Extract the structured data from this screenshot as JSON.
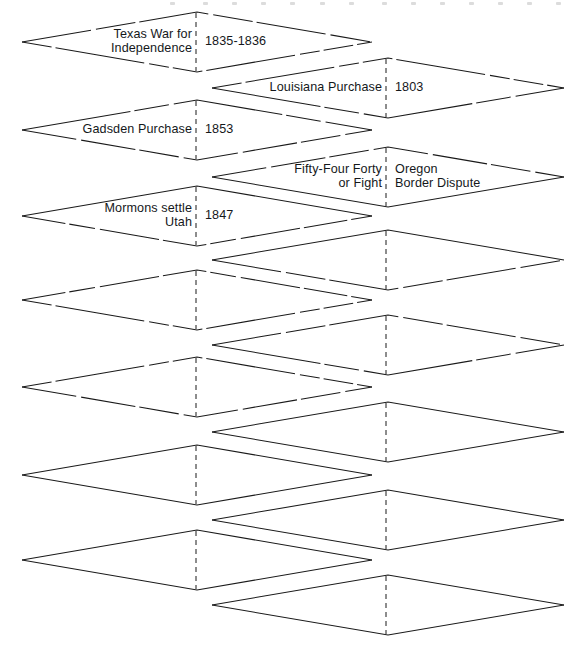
{
  "diagram": {
    "type": "overlapping-diamond-matching-chart",
    "orientation": "vertical-zigzag-staircase",
    "stroke_color": "#1a1a1a",
    "text_color": "#15181b",
    "background_color": "#ffffff",
    "divider_style": "dashed-vertical-center-line",
    "columns": {
      "left": {
        "x_left": 22,
        "x_right": 372,
        "center_x": 196
      },
      "right": {
        "x_left": 212,
        "x_right": 564,
        "center_x": 386
      }
    },
    "row_spacing_px": 43,
    "total_shapes": 14,
    "filled_shapes": 5,
    "empty_shapes": 9,
    "shapes": [
      {
        "index": 1,
        "column": "left",
        "center_y": 42,
        "left_label": "Texas War for\nIndependence",
        "right_label": "1835-1836",
        "filled": true
      },
      {
        "index": 2,
        "column": "right",
        "center_y": 88,
        "left_label": "Louisiana Purchase",
        "right_label": "1803",
        "filled": true
      },
      {
        "index": 3,
        "column": "left",
        "center_y": 130,
        "left_label": "Gadsden Purchase",
        "right_label": "1853",
        "filled": true
      },
      {
        "index": 4,
        "column": "right",
        "center_y": 177,
        "left_label": "Fifty-Four Forty\nor Fight",
        "right_label": "Oregon\nBorder Dispute",
        "filled": true
      },
      {
        "index": 5,
        "column": "left",
        "center_y": 216,
        "left_label": "Mormons settle\nUtah",
        "right_label": "1847",
        "filled": true
      },
      {
        "index": 6,
        "column": "right",
        "center_y": 260,
        "left_label": "",
        "right_label": "",
        "filled": false
      },
      {
        "index": 7,
        "column": "left",
        "center_y": 300,
        "left_label": "",
        "right_label": "",
        "filled": false
      },
      {
        "index": 8,
        "column": "right",
        "center_y": 345,
        "left_label": "",
        "right_label": "",
        "filled": false
      },
      {
        "index": 9,
        "column": "left",
        "center_y": 387,
        "left_label": "",
        "right_label": "",
        "filled": false
      },
      {
        "index": 10,
        "column": "right",
        "center_y": 432,
        "left_label": "",
        "right_label": "",
        "filled": false
      },
      {
        "index": 11,
        "column": "left",
        "center_y": 475,
        "left_label": "",
        "right_label": "",
        "filled": false
      },
      {
        "index": 12,
        "column": "right",
        "center_y": 520,
        "left_label": "",
        "right_label": "",
        "filled": false
      },
      {
        "index": 13,
        "column": "left",
        "center_y": 560,
        "left_label": "",
        "right_label": "",
        "filled": false
      },
      {
        "index": 14,
        "column": "right",
        "center_y": 605,
        "left_label": "",
        "right_label": "",
        "filled": false
      }
    ],
    "scan_artifact_dots_x": [
      170,
      203,
      232,
      261,
      290,
      320,
      349,
      382,
      411,
      440,
      469,
      498,
      527,
      556
    ]
  }
}
